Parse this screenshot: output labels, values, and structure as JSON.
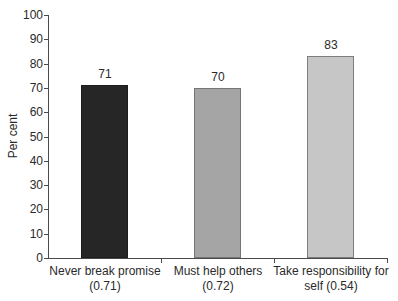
{
  "chart_data": {
    "type": "bar",
    "title": "",
    "xlabel": "",
    "ylabel": "Per cent",
    "ylim": [
      0,
      100
    ],
    "yticks": [
      0,
      10,
      20,
      30,
      40,
      50,
      60,
      70,
      80,
      90,
      100
    ],
    "grid": false,
    "legend": false,
    "categories": [
      "Never break promise (0.71)",
      "Must help others (0.72)",
      "Take responsibility for self (0.54)"
    ],
    "values": [
      71,
      70,
      83
    ],
    "data_labels": [
      "71",
      "70",
      "83"
    ],
    "bar_colors": [
      "#262626",
      "#a5a5a5",
      "#c6c6c6"
    ],
    "bar_border_colors": [
      "#1c1c1c",
      "#757575",
      "#7d7d7d"
    ],
    "axis_color": "#4a4a4a"
  }
}
